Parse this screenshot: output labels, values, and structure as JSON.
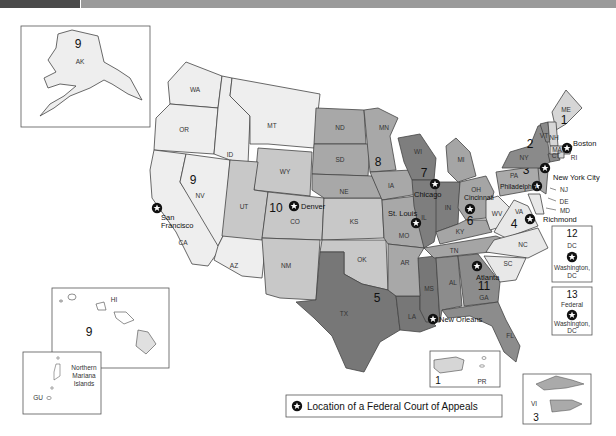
{
  "colors": {
    "c1": "#d6d6d6",
    "c2": "#8a8a8a",
    "c3": "#aaaaaa",
    "c4": "#e8e8e8",
    "c5": "#777777",
    "c6": "#a5a5a5",
    "c7": "#7e7e7e",
    "c8": "#a8a8a8",
    "c9": "#eeeeee",
    "c10": "#c8c8c8",
    "c11": "#8c8c8c",
    "background": "#ffffff"
  },
  "circuits": [
    {
      "number": "1",
      "states": [
        "ME",
        "NH",
        "MA",
        "RI",
        "PR"
      ],
      "seat": "Boston"
    },
    {
      "number": "2",
      "states": [
        "NY",
        "VT",
        "CT"
      ],
      "seat": "New York City"
    },
    {
      "number": "3",
      "states": [
        "PA",
        "NJ",
        "DE",
        "VI"
      ],
      "seat": "Philadelphia"
    },
    {
      "number": "4",
      "states": [
        "MD",
        "VA",
        "WV",
        "NC",
        "SC"
      ],
      "seat": "Richmond"
    },
    {
      "number": "5",
      "states": [
        "TX",
        "LA",
        "MS"
      ],
      "seat": "New Orleans"
    },
    {
      "number": "6",
      "states": [
        "MI",
        "OH",
        "KY",
        "TN"
      ],
      "seat": "Cincinnati"
    },
    {
      "number": "7",
      "states": [
        "WI",
        "IL",
        "IN"
      ],
      "seat": "Chicago"
    },
    {
      "number": "8",
      "states": [
        "ND",
        "SD",
        "NE",
        "MN",
        "IA",
        "MO",
        "AR"
      ],
      "seat": "St. Louis"
    },
    {
      "number": "9",
      "states": [
        "WA",
        "OR",
        "CA",
        "NV",
        "ID",
        "MT",
        "AZ",
        "AK",
        "HI",
        "GU",
        "Northern Mariana Islands"
      ],
      "seat": "San Francisco"
    },
    {
      "number": "10",
      "states": [
        "WY",
        "UT",
        "CO",
        "KS",
        "OK",
        "NM"
      ],
      "seat": "Denver"
    },
    {
      "number": "11",
      "states": [
        "AL",
        "GA",
        "FL"
      ],
      "seat": "Atlanta"
    },
    {
      "number": "12",
      "states": [
        "DC"
      ],
      "seat": "Washington, DC"
    },
    {
      "number": "13",
      "states": [
        "Federal"
      ],
      "seat": "Washington, DC"
    }
  ],
  "labels": {
    "states": {
      "WA": "WA",
      "OR": "OR",
      "CA": "CA",
      "NV": "NV",
      "ID": "ID",
      "MT": "MT",
      "AZ": "AZ",
      "WY": "WY",
      "UT": "UT",
      "CO": "CO",
      "NM": "NM",
      "KS": "KS",
      "OK": "OK",
      "TX": "TX",
      "ND": "ND",
      "SD": "SD",
      "NE": "NE",
      "MN": "MN",
      "IA": "IA",
      "MO": "MO",
      "AR": "AR",
      "LA": "LA",
      "MS": "MS",
      "WI": "WI",
      "IL": "IL",
      "IN": "IN",
      "MI": "MI",
      "OH": "OH",
      "KY": "KY",
      "TN": "TN",
      "AL": "AL",
      "GA": "GA",
      "FL": "FL",
      "SC": "SC",
      "NC": "NC",
      "VA": "VA",
      "WV": "WV",
      "PA": "PA",
      "NY": "NY",
      "VT": "VT",
      "NH": "NH",
      "ME": "ME",
      "MA": "MA",
      "CT": "CT",
      "RI": "RI",
      "NJ": "NJ",
      "DE": "DE",
      "MD": "MD",
      "AK": "AK",
      "HI": "HI",
      "PR": "PR",
      "VI": "VI",
      "GU": "GU"
    },
    "cities": {
      "boston": "Boston",
      "nyc": "New York City",
      "philadelphia": "Philadelphia",
      "richmond": "Richmond",
      "new_orleans": "New Orleans",
      "cincinnati": "Cincinnati",
      "chicago": "Chicago",
      "st_louis": "St. Louis",
      "san_francisco_1": "San",
      "san_francisco_2": "Francisco",
      "denver": "Denver",
      "atlanta": "Atlanta"
    },
    "numbers": {
      "n1": "1",
      "n2": "2",
      "n3": "3",
      "n4": "4",
      "n5": "5",
      "n6": "6",
      "n7": "7",
      "n8": "8",
      "n9": "9",
      "n10": "10",
      "n11": "11",
      "n12": "12",
      "n13": "13"
    },
    "insets": {
      "nmi_1": "Northern",
      "nmi_2": "Mariana",
      "nmi_3": "Islands",
      "dc_box_code": "DC",
      "dc_box_city_1": "Washington,",
      "dc_box_city_2": "DC",
      "fed_box_code": "Federal",
      "fed_box_city_1": "Washington,",
      "fed_box_city_2": "DC"
    }
  },
  "legend": {
    "icon": "star-in-circle-icon",
    "text": "Location of a Federal Court of Appeals"
  }
}
